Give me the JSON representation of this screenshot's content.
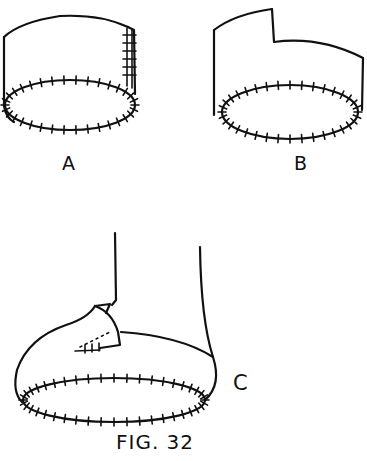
{
  "figure": {
    "caption": "FIG. 32",
    "panels": [
      {
        "id": "a",
        "label": "A",
        "description": "Cylinder band with stitched back seam and stitched bottom ellipse"
      },
      {
        "id": "b",
        "label": "B",
        "description": "Cylinder band with stepped top edge and stitched bottom ellipse"
      },
      {
        "id": "c",
        "label": "C",
        "description": "Shoe shape on leg with stitched sole and stitched tongue flap"
      }
    ]
  },
  "colors": {
    "ink": "#111111",
    "paper": "#ffffff"
  }
}
